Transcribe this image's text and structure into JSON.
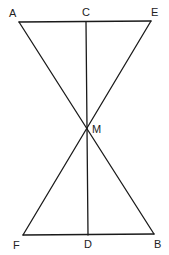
{
  "diagram": {
    "type": "geometry",
    "colors": {
      "line": "#1a1a1a",
      "label": "#222222",
      "background": "#ffffff"
    },
    "points": {
      "A": {
        "label": "A",
        "x": 19,
        "y": 22
      },
      "C": {
        "label": "C",
        "x": 86,
        "y": 22
      },
      "E": {
        "label": "E",
        "x": 151,
        "y": 21
      },
      "M": {
        "label": "M",
        "x": 87,
        "y": 127
      },
      "F": {
        "label": "F",
        "x": 23,
        "y": 235
      },
      "D": {
        "label": "D",
        "x": 88,
        "y": 235
      },
      "B": {
        "label": "B",
        "x": 154,
        "y": 234
      }
    },
    "segments": [
      [
        "A",
        "E"
      ],
      [
        "A",
        "B"
      ],
      [
        "E",
        "F"
      ],
      [
        "F",
        "B"
      ],
      [
        "C",
        "D"
      ]
    ],
    "labels": {
      "A": "A",
      "C": "C",
      "E": "E",
      "M": "M",
      "F": "F",
      "D": "D",
      "B": "B"
    }
  }
}
